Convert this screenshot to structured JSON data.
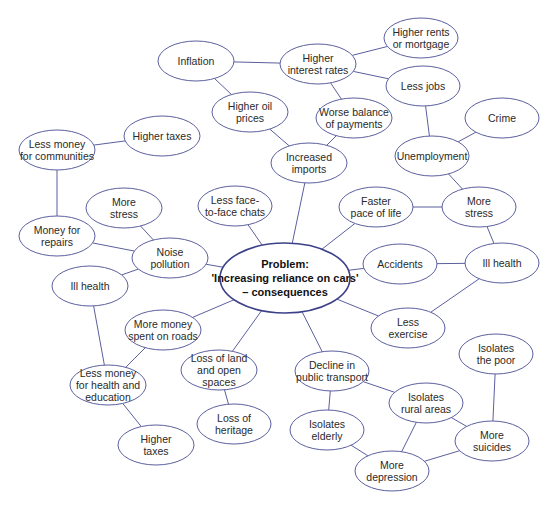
{
  "diagram": {
    "type": "mind-map",
    "colors": {
      "stroke": "#5b5f9e",
      "central_stroke": "#3c4088",
      "text": "#2a2a2a",
      "background": "#ffffff"
    },
    "nodes": [
      {
        "id": "center",
        "lines": [
          "Problem:",
          "'Increasing reliance on cars'",
          "– consequences"
        ],
        "cx": 285,
        "cy": 278,
        "rx": 65,
        "ry": 35,
        "central": true
      },
      {
        "id": "inflation",
        "lines": [
          "Inflation"
        ],
        "cx": 196,
        "cy": 61,
        "rx": 38,
        "ry": 20
      },
      {
        "id": "higher-interest-rates",
        "lines": [
          "Higher",
          "interest rates"
        ],
        "cx": 318,
        "cy": 64,
        "rx": 38,
        "ry": 20
      },
      {
        "id": "higher-rents",
        "lines": [
          "Higher rents",
          "or mortgage"
        ],
        "cx": 421,
        "cy": 38,
        "rx": 37,
        "ry": 20
      },
      {
        "id": "less-jobs",
        "lines": [
          "Less jobs"
        ],
        "cx": 423,
        "cy": 86,
        "rx": 37,
        "ry": 20
      },
      {
        "id": "higher-oil-prices",
        "lines": [
          "Higher oil",
          "prices"
        ],
        "cx": 250,
        "cy": 112,
        "rx": 38,
        "ry": 20
      },
      {
        "id": "worse-balance",
        "lines": [
          "Worse balance",
          "of payments"
        ],
        "cx": 354,
        "cy": 118,
        "rx": 38,
        "ry": 20
      },
      {
        "id": "crime",
        "lines": [
          "Crime"
        ],
        "cx": 502,
        "cy": 118,
        "rx": 37,
        "ry": 20
      },
      {
        "id": "higher-taxes-top",
        "lines": [
          "Higher taxes"
        ],
        "cx": 162,
        "cy": 136,
        "rx": 38,
        "ry": 20
      },
      {
        "id": "less-money-communities",
        "lines": [
          "Less money",
          "for communities"
        ],
        "cx": 57,
        "cy": 150,
        "rx": 38,
        "ry": 20
      },
      {
        "id": "unemployment",
        "lines": [
          "Unemployment"
        ],
        "cx": 432,
        "cy": 156,
        "rx": 37,
        "ry": 20
      },
      {
        "id": "increased-imports",
        "lines": [
          "Increased",
          "imports"
        ],
        "cx": 309,
        "cy": 163,
        "rx": 38,
        "ry": 20
      },
      {
        "id": "more-stress-left",
        "lines": [
          "More",
          "stress"
        ],
        "cx": 124,
        "cy": 208,
        "rx": 38,
        "ry": 20
      },
      {
        "id": "less-face-chats",
        "lines": [
          "Less face-",
          "to-face chats"
        ],
        "cx": 235,
        "cy": 206,
        "rx": 37,
        "ry": 20
      },
      {
        "id": "faster-pace",
        "lines": [
          "Faster",
          "pace of life"
        ],
        "cx": 376,
        "cy": 207,
        "rx": 37,
        "ry": 20
      },
      {
        "id": "more-stress-right",
        "lines": [
          "More",
          "stress"
        ],
        "cx": 479,
        "cy": 207,
        "rx": 37,
        "ry": 20
      },
      {
        "id": "money-repairs",
        "lines": [
          "Money for",
          "repairs"
        ],
        "cx": 57,
        "cy": 236,
        "rx": 38,
        "ry": 20
      },
      {
        "id": "noise-pollution",
        "lines": [
          "Noise",
          "pollution"
        ],
        "cx": 170,
        "cy": 258,
        "rx": 38,
        "ry": 20
      },
      {
        "id": "accidents",
        "lines": [
          "Accidents"
        ],
        "cx": 400,
        "cy": 264,
        "rx": 37,
        "ry": 20
      },
      {
        "id": "ill-health-right",
        "lines": [
          "Ill health"
        ],
        "cx": 502,
        "cy": 263,
        "rx": 37,
        "ry": 20
      },
      {
        "id": "ill-health-left",
        "lines": [
          "Ill health"
        ],
        "cx": 90,
        "cy": 286,
        "rx": 38,
        "ry": 20
      },
      {
        "id": "more-money-roads",
        "lines": [
          "More money",
          "spent on roads"
        ],
        "cx": 163,
        "cy": 330,
        "rx": 38,
        "ry": 20
      },
      {
        "id": "less-exercise",
        "lines": [
          "Less",
          "exercise"
        ],
        "cx": 408,
        "cy": 328,
        "rx": 37,
        "ry": 20
      },
      {
        "id": "loss-land",
        "lines": [
          "Loss of land",
          "and open",
          "spaces"
        ],
        "cx": 219,
        "cy": 370,
        "rx": 38,
        "ry": 20
      },
      {
        "id": "less-money-health",
        "lines": [
          "Less money",
          "for health and",
          "education"
        ],
        "cx": 108,
        "cy": 385,
        "rx": 38,
        "ry": 20
      },
      {
        "id": "isolates-poor",
        "lines": [
          "Isolates",
          "the poor"
        ],
        "cx": 496,
        "cy": 354,
        "rx": 37,
        "ry": 20
      },
      {
        "id": "decline-transport",
        "lines": [
          "Decline in",
          "public transport"
        ],
        "cx": 332,
        "cy": 371,
        "rx": 37,
        "ry": 20
      },
      {
        "id": "isolates-rural",
        "lines": [
          "Isolates",
          "rural areas"
        ],
        "cx": 426,
        "cy": 403,
        "rx": 37,
        "ry": 20
      },
      {
        "id": "loss-heritage",
        "lines": [
          "Loss of",
          "heritage"
        ],
        "cx": 234,
        "cy": 424,
        "rx": 37,
        "ry": 20
      },
      {
        "id": "isolates-elderly",
        "lines": [
          "Isolates",
          "elderly"
        ],
        "cx": 327,
        "cy": 430,
        "rx": 37,
        "ry": 20
      },
      {
        "id": "more-suicides",
        "lines": [
          "More",
          "suicides"
        ],
        "cx": 492,
        "cy": 441,
        "rx": 37,
        "ry": 20
      },
      {
        "id": "higher-taxes-bottom",
        "lines": [
          "Higher",
          "taxes"
        ],
        "cx": 156,
        "cy": 445,
        "rx": 38,
        "ry": 20
      },
      {
        "id": "more-depression",
        "lines": [
          "More",
          "depression"
        ],
        "cx": 392,
        "cy": 471,
        "rx": 37,
        "ry": 20
      }
    ],
    "edges": [
      [
        "center",
        "increased-imports"
      ],
      [
        "center",
        "less-face-chats"
      ],
      [
        "center",
        "faster-pace"
      ],
      [
        "center",
        "noise-pollution"
      ],
      [
        "center",
        "accidents"
      ],
      [
        "center",
        "more-money-roads"
      ],
      [
        "center",
        "less-exercise"
      ],
      [
        "center",
        "loss-land"
      ],
      [
        "center",
        "decline-transport"
      ],
      [
        "inflation",
        "higher-interest-rates"
      ],
      [
        "inflation",
        "higher-oil-prices"
      ],
      [
        "higher-interest-rates",
        "higher-rents"
      ],
      [
        "higher-interest-rates",
        "less-jobs"
      ],
      [
        "higher-interest-rates",
        "worse-balance"
      ],
      [
        "higher-oil-prices",
        "increased-imports"
      ],
      [
        "worse-balance",
        "increased-imports"
      ],
      [
        "less-jobs",
        "unemployment"
      ],
      [
        "unemployment",
        "crime"
      ],
      [
        "unemployment",
        "more-stress-right"
      ],
      [
        "faster-pace",
        "more-stress-right"
      ],
      [
        "more-stress-right",
        "ill-health-right"
      ],
      [
        "accidents",
        "ill-health-right"
      ],
      [
        "less-exercise",
        "ill-health-right"
      ],
      [
        "less-money-communities",
        "higher-taxes-top"
      ],
      [
        "less-money-communities",
        "money-repairs"
      ],
      [
        "money-repairs",
        "noise-pollution"
      ],
      [
        "more-stress-left",
        "noise-pollution"
      ],
      [
        "noise-pollution",
        "ill-health-left"
      ],
      [
        "ill-health-left",
        "less-money-health"
      ],
      [
        "more-money-roads",
        "less-money-health"
      ],
      [
        "less-money-health",
        "higher-taxes-bottom"
      ],
      [
        "loss-land",
        "loss-heritage"
      ],
      [
        "decline-transport",
        "isolates-rural"
      ],
      [
        "decline-transport",
        "isolates-elderly"
      ],
      [
        "isolates-rural",
        "more-depression"
      ],
      [
        "isolates-rural",
        "more-suicides"
      ],
      [
        "isolates-elderly",
        "more-depression"
      ],
      [
        "more-depression",
        "more-suicides"
      ],
      [
        "isolates-poor",
        "more-suicides"
      ]
    ]
  }
}
